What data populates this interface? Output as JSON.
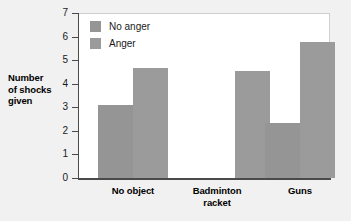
{
  "chart_data": {
    "type": "bar",
    "title": "",
    "xlabel": "",
    "ylabel": "Number of shocks given",
    "ylabel_lines": [
      "Number",
      "of shocks",
      "given"
    ],
    "categories": [
      "No object",
      "Badminton racket",
      "Guns"
    ],
    "category_label_lines": [
      [
        "No object"
      ],
      [
        "Badminton",
        "racket"
      ],
      [
        "Guns"
      ]
    ],
    "series": [
      {
        "name": "No anger",
        "values": [
          3.1,
          null,
          2.35
        ],
        "color": "#959595"
      },
      {
        "name": "Anger",
        "values": [
          4.65,
          4.55,
          5.75
        ],
        "color": "#9b9b9b"
      }
    ],
    "ylim": [
      0,
      7
    ],
    "ytick_labels": [
      "0",
      "1",
      "2",
      "3",
      "4",
      "5",
      "6",
      "7"
    ],
    "ytick_values": [
      0,
      1,
      2,
      3,
      4,
      5,
      6,
      7
    ],
    "grid": false,
    "legend_position": "top-left-inside",
    "legend_entries": [
      "No anger",
      "Anger"
    ]
  },
  "colors": {
    "page_background": "#f1f1f1",
    "plot_background": "#ffffff",
    "axis": "#4a4a4a",
    "bar_no_anger": "#959595",
    "bar_anger": "#9b9b9b",
    "text": "#000000"
  }
}
